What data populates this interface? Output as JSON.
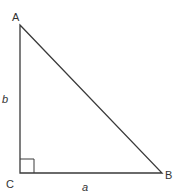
{
  "diagram": {
    "type": "right-triangle",
    "stroke_color": "#3a3a3a",
    "vertices": {
      "A": {
        "label": "A",
        "x": 20,
        "y": 25
      },
      "B": {
        "label": "B",
        "x": 162,
        "y": 173
      },
      "C": {
        "label": "C",
        "x": 20,
        "y": 173
      }
    },
    "sides": {
      "a": {
        "label": "a",
        "between": [
          "C",
          "B"
        ]
      },
      "b": {
        "label": "b",
        "between": [
          "A",
          "C"
        ]
      }
    },
    "right_angle_at": "C"
  }
}
